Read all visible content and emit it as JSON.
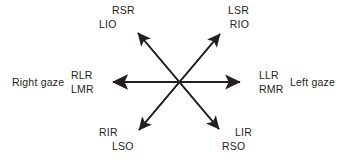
{
  "figure": {
    "type": "extraocular-muscle-gaze-diagram",
    "background_color": "#ffffff",
    "line_color": "#231f20",
    "text_color": "#231f20"
  },
  "gaze": {
    "right_label": "Right gaze",
    "left_label": "Left gaze"
  },
  "labels": {
    "upper_left": {
      "line1": "RSR",
      "line2": "LIO"
    },
    "upper_right": {
      "line1": "LSR",
      "line2": "RIO"
    },
    "mid_left": {
      "line1": "RLR",
      "line2": "LMR"
    },
    "mid_right": {
      "line1": "LLR",
      "line2": "RMR"
    },
    "lower_left": {
      "line1": "RIR",
      "line2": "LSO"
    },
    "lower_right": {
      "line1": "LIR",
      "line2": "RSO"
    }
  },
  "arrows": [
    {
      "name": "horizontal",
      "from": [
        247,
        82
      ],
      "to": [
        106,
        82
      ]
    },
    {
      "name": "diagonal-ne-sw",
      "from": [
        226,
        28
      ],
      "to": [
        133,
        137
      ]
    },
    {
      "name": "diagonal-nw-se",
      "from": [
        132,
        27
      ],
      "to": [
        225,
        135
      ]
    }
  ]
}
